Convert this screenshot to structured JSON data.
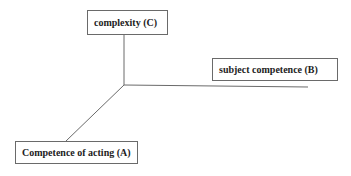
{
  "diagram": {
    "type": "3-axis competence model",
    "axes": [
      {
        "id": "C",
        "label": "complexity (C)",
        "direction": "vertical-up"
      },
      {
        "id": "B",
        "label": "subject competence (B)",
        "direction": "horizontal-right"
      },
      {
        "id": "A",
        "label": "Competence of acting (A)",
        "direction": "diagonal-down-left"
      }
    ],
    "colors": {
      "line": "#6a6a6a",
      "text": "#222222",
      "background": "#ffffff"
    }
  }
}
